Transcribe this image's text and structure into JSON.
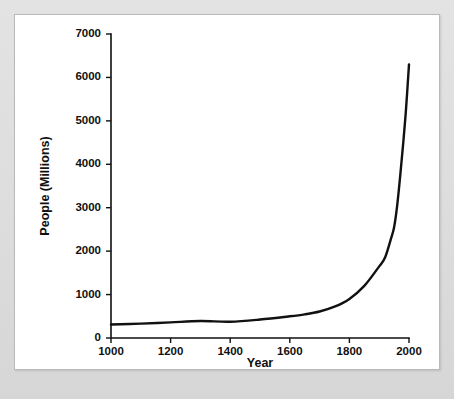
{
  "figure": {
    "background_color": "#dddddd",
    "card_color": "#ffffff",
    "card_border_color": "#b9b9b9"
  },
  "chart_data": {
    "type": "line",
    "title": "",
    "subtitle": "",
    "xlabel": "Year",
    "ylabel": "People (Millions)",
    "xlim": [
      1000,
      2000
    ],
    "ylim": [
      0,
      7000
    ],
    "grid": false,
    "legend": false,
    "legend_position": "none",
    "line_color": "#111111",
    "x_ticks": [
      1000,
      1200,
      1400,
      1600,
      1800,
      2000
    ],
    "x_tick_labels": [
      "1000",
      "1200",
      "1400",
      "1600",
      "1800",
      "2000"
    ],
    "y_ticks": [
      0,
      1000,
      2000,
      3000,
      4000,
      5000,
      6000,
      7000
    ],
    "y_tick_labels": [
      "0",
      "1000",
      "2000",
      "3000",
      "4000",
      "5000",
      "6000",
      "7000"
    ],
    "series": [
      {
        "name": "World population",
        "x": [
          1000,
          1100,
          1200,
          1300,
          1400,
          1500,
          1600,
          1650,
          1700,
          1750,
          1800,
          1850,
          1900,
          1920,
          1940,
          1950,
          1960,
          1970,
          1980,
          1990,
          2000
        ],
        "values": [
          310,
          330,
          360,
          390,
          375,
          425,
          500,
          545,
          610,
          720,
          900,
          1200,
          1650,
          1860,
          2300,
          2550,
          3030,
          3700,
          4440,
          5270,
          6300
        ]
      }
    ],
    "annotations": []
  }
}
